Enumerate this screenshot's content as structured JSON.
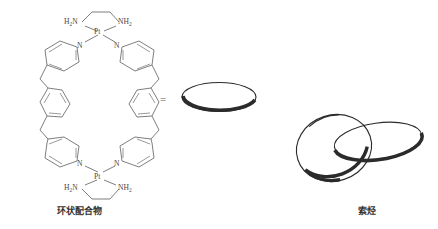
{
  "figure": {
    "background_color": "#ffffff",
    "line_color": "#676767",
    "ring_color": "#2b2b2b",
    "equals_symbol": "="
  },
  "molecule": {
    "name_label": "环状配合物",
    "atoms": {
      "platinum": "Pt",
      "nitrogen": "N",
      "amine_left": "H",
      "amine_left_sub": "2",
      "amine_left_tail": "N",
      "amine_right": "NH",
      "amine_right_sub": "2"
    },
    "labels": [
      {
        "id": "pt-top",
        "text": "Pt",
        "x": 100,
        "y": 31
      },
      {
        "id": "pt-bottom",
        "text": "Pt",
        "x": 100,
        "y": 176
      },
      {
        "id": "n-top-left",
        "text": "N",
        "x": 81,
        "y": 45
      },
      {
        "id": "n-top-right",
        "text": "N",
        "x": 117,
        "y": 45
      },
      {
        "id": "n-bottom-left",
        "text": "N",
        "x": 81,
        "y": 163
      },
      {
        "id": "n-bottom-right",
        "text": "N",
        "x": 117,
        "y": 163
      }
    ]
  },
  "ring_single": {
    "name_label": "",
    "description": "single macrocycle ring ellipse"
  },
  "catenane": {
    "name_label": "索烃",
    "description": "two mechanically interlocked rings"
  }
}
